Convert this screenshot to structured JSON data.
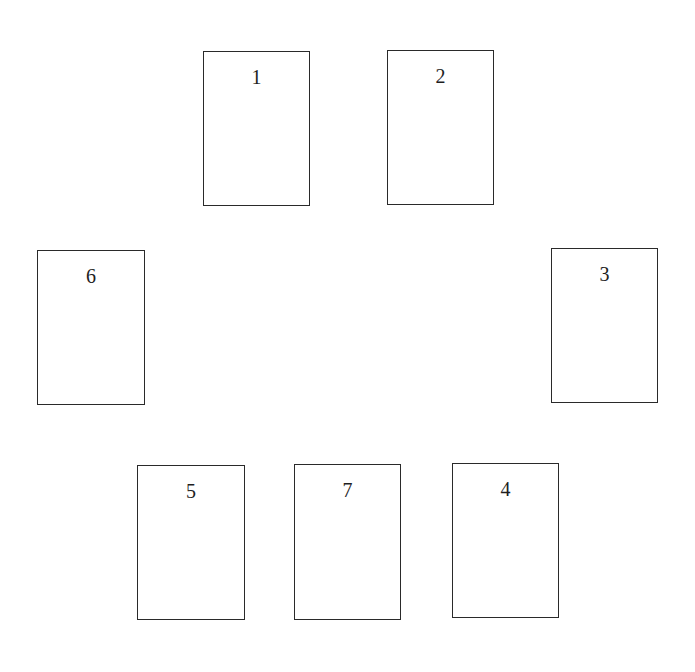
{
  "diagram": {
    "type": "card-spread-layout",
    "card_count": 7,
    "colors": {
      "background": "#ffffff",
      "card_border": "#2a2a2a",
      "text": "#1e1e1e"
    },
    "cards": [
      {
        "label": "1",
        "x": 203,
        "y": 51,
        "w": 107,
        "h": 155
      },
      {
        "label": "2",
        "x": 387,
        "y": 50,
        "w": 107,
        "h": 155
      },
      {
        "label": "3",
        "x": 551,
        "y": 248,
        "w": 107,
        "h": 155
      },
      {
        "label": "4",
        "x": 452,
        "y": 463,
        "w": 107,
        "h": 155
      },
      {
        "label": "5",
        "x": 137,
        "y": 465,
        "w": 108,
        "h": 155
      },
      {
        "label": "6",
        "x": 37,
        "y": 250,
        "w": 108,
        "h": 155
      },
      {
        "label": "7",
        "x": 294,
        "y": 464,
        "w": 107,
        "h": 156
      }
    ]
  }
}
